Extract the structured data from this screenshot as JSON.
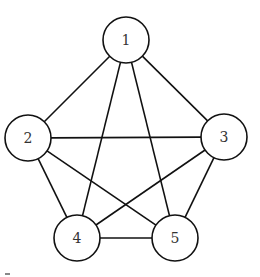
{
  "diagram": {
    "type": "graph",
    "nodes": [
      {
        "id": "1",
        "label": "1",
        "x": 126,
        "y": 40,
        "r": 23
      },
      {
        "id": "2",
        "label": "2",
        "x": 28,
        "y": 138,
        "r": 23
      },
      {
        "id": "3",
        "label": "3",
        "x": 224,
        "y": 137,
        "r": 23
      },
      {
        "id": "4",
        "label": "4",
        "x": 77,
        "y": 238,
        "r": 23
      },
      {
        "id": "5",
        "label": "5",
        "x": 175,
        "y": 238,
        "r": 23
      }
    ],
    "edges": [
      {
        "from": "1",
        "to": "2"
      },
      {
        "from": "1",
        "to": "3"
      },
      {
        "from": "1",
        "to": "4"
      },
      {
        "from": "1",
        "to": "5"
      },
      {
        "from": "2",
        "to": "3"
      },
      {
        "from": "2",
        "to": "4"
      },
      {
        "from": "2",
        "to": "5"
      },
      {
        "from": "3",
        "to": "4"
      },
      {
        "from": "3",
        "to": "5"
      },
      {
        "from": "4",
        "to": "5"
      }
    ],
    "colors": {
      "stroke": "#111111",
      "label": "#333333",
      "background": "#ffffff"
    }
  }
}
